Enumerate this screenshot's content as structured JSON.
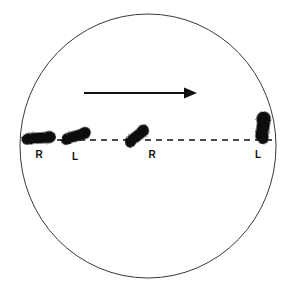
{
  "figure": {
    "background_color": "#ffffff",
    "ink_color": "#111111",
    "outline_color": "#444444"
  },
  "boundary": {
    "name": "circle",
    "center_x": 148,
    "center_y": 146,
    "radius_x": 128,
    "radius_y": 132,
    "stroke_color": "#3a3a3a",
    "stroke_width": 1
  },
  "direction_arrow": {
    "label": "",
    "x_start": 84,
    "x_end": 197,
    "y": 93,
    "color": "#111111",
    "head_length": 13,
    "head_width": 11,
    "shaft_width": 2
  },
  "midline": {
    "name": "gait-line",
    "x_start": 24,
    "x_end": 272,
    "y": 140,
    "color": "#111111",
    "dash": "6 5",
    "stroke_width": 1.4
  },
  "footprints": [
    {
      "id": "print-1",
      "label": "R",
      "side": "right",
      "cx": 39,
      "cy": 138,
      "length": 32,
      "width": 11,
      "rotation": -3,
      "label_x": 39,
      "label_y": 158,
      "color": "#111111"
    },
    {
      "id": "print-2",
      "label": "L",
      "side": "left",
      "cx": 76,
      "cy": 136,
      "length": 29,
      "width": 11,
      "rotation": -16,
      "label_x": 75,
      "label_y": 160,
      "color": "#111111"
    },
    {
      "id": "print-3",
      "label": "R",
      "side": "right",
      "cx": 137,
      "cy": 136,
      "length": 27,
      "width": 11,
      "rotation": -38,
      "label_x": 152,
      "label_y": 158,
      "color": "#111111"
    },
    {
      "id": "print-4",
      "label": "L",
      "side": "left",
      "cx": 263,
      "cy": 127,
      "length": 31,
      "width": 13,
      "rotation": -82,
      "label_x": 258,
      "label_y": 158,
      "color": "#111111"
    }
  ],
  "legend": {
    "r_meaning": "R",
    "l_meaning": "L"
  }
}
